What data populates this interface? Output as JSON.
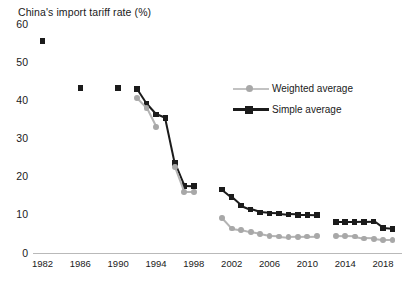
{
  "chart_data": {
    "type": "line",
    "title": "China's import tariff rate (%)",
    "xlabel": "",
    "ylabel": "",
    "ylim": [
      0,
      60
    ],
    "xlim": [
      1981,
      2020
    ],
    "ytick_labels": [
      "0",
      "10",
      "20",
      "30",
      "40",
      "50",
      "60"
    ],
    "yticks": [
      0,
      10,
      20,
      30,
      40,
      50,
      60
    ],
    "xtick_labels": [
      "1982",
      "1986",
      "1990",
      "1994",
      "1998",
      "2002",
      "2006",
      "2010",
      "2014",
      "2018"
    ],
    "xticks": [
      1982,
      1986,
      1990,
      1994,
      1998,
      2002,
      2006,
      2010,
      2014,
      2018
    ],
    "grid": false,
    "legend_position": "upper right",
    "colors": {
      "weighted_average": "#a8a8a8",
      "simple_average": "#1b1b1b",
      "axis": "#b9b9b9",
      "text": "#1a1a1a",
      "background": "#ffffff"
    },
    "series": [
      {
        "name": "Simple average",
        "marker": "square",
        "color": "#1b1b1b",
        "points": [
          {
            "x": 1982,
            "y": 55.6
          },
          {
            "x": 1986,
            "y": 43.2
          },
          {
            "x": 1990,
            "y": 43.2
          },
          {
            "x": 1992,
            "y": 42.9
          },
          {
            "x": 1993,
            "y": 39.1
          },
          {
            "x": 1994,
            "y": 36.3
          },
          {
            "x": 1995,
            "y": 35.3
          },
          {
            "x": 1996,
            "y": 23.6
          },
          {
            "x": 1997,
            "y": 17.6
          },
          {
            "x": 1998,
            "y": 17.5
          },
          {
            "x": 2001,
            "y": 16.6
          },
          {
            "x": 2002,
            "y": 14.6
          },
          {
            "x": 2003,
            "y": 12.4
          },
          {
            "x": 2004,
            "y": 11.4
          },
          {
            "x": 2005,
            "y": 10.6
          },
          {
            "x": 2006,
            "y": 10.4
          },
          {
            "x": 2007,
            "y": 10.3
          },
          {
            "x": 2008,
            "y": 10.1
          },
          {
            "x": 2009,
            "y": 10.0
          },
          {
            "x": 2010,
            "y": 10.0
          },
          {
            "x": 2011,
            "y": 9.9
          },
          {
            "x": 2013,
            "y": 8.1
          },
          {
            "x": 2014,
            "y": 8.1
          },
          {
            "x": 2015,
            "y": 8.1
          },
          {
            "x": 2016,
            "y": 8.2
          },
          {
            "x": 2017,
            "y": 8.3
          },
          {
            "x": 2018,
            "y": 6.5
          },
          {
            "x": 2019,
            "y": 6.3
          }
        ]
      },
      {
        "name": "Weighted average",
        "marker": "circle",
        "color": "#a8a8a8",
        "points": [
          {
            "x": 1992,
            "y": 40.6
          },
          {
            "x": 1993,
            "y": 38.0
          },
          {
            "x": 1994,
            "y": 33.0
          },
          {
            "x": 1996,
            "y": 22.6
          },
          {
            "x": 1997,
            "y": 16.0
          },
          {
            "x": 1998,
            "y": 16.0
          },
          {
            "x": 2001,
            "y": 9.1
          },
          {
            "x": 2002,
            "y": 6.4
          },
          {
            "x": 2003,
            "y": 6.0
          },
          {
            "x": 2004,
            "y": 5.4
          },
          {
            "x": 2005,
            "y": 4.9
          },
          {
            "x": 2006,
            "y": 4.4
          },
          {
            "x": 2007,
            "y": 4.3
          },
          {
            "x": 2008,
            "y": 4.1
          },
          {
            "x": 2009,
            "y": 4.2
          },
          {
            "x": 2010,
            "y": 4.3
          },
          {
            "x": 2011,
            "y": 4.4
          },
          {
            "x": 2013,
            "y": 4.5
          },
          {
            "x": 2014,
            "y": 4.4
          },
          {
            "x": 2015,
            "y": 4.3
          },
          {
            "x": 2016,
            "y": 3.8
          },
          {
            "x": 2017,
            "y": 3.7
          },
          {
            "x": 2018,
            "y": 3.4
          },
          {
            "x": 2019,
            "y": 3.4
          }
        ]
      }
    ],
    "legend": [
      {
        "label": "Weighted average",
        "color": "#a8a8a8",
        "marker": "circle"
      },
      {
        "label": "Simple average",
        "color": "#1b1b1b",
        "marker": "square"
      }
    ]
  }
}
